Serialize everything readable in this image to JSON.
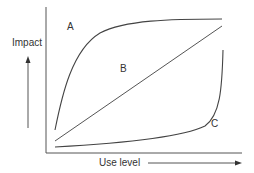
{
  "diagram": {
    "y_axis_label": "Impact",
    "x_axis_label": "Use level",
    "curves": [
      {
        "id": "A",
        "label": "A",
        "shape": "concave, rapid rise then plateau"
      },
      {
        "id": "B",
        "label": "B",
        "shape": "linear"
      },
      {
        "id": "C",
        "label": "C",
        "shape": "convex, flat then sharp rise"
      }
    ],
    "colors": {
      "line": "#444444",
      "text": "#333333",
      "background": "#ffffff"
    }
  }
}
